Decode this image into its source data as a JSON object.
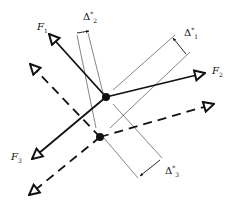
{
  "diagram": {
    "forces": [
      {
        "id": "F1",
        "label": "F",
        "sub": "1"
      },
      {
        "id": "F2",
        "label": "F",
        "sub": "2"
      },
      {
        "id": "F3",
        "label": "F",
        "sub": "3"
      }
    ],
    "offsets": [
      {
        "id": "delta1",
        "label": "Δ",
        "sub": "1",
        "sup": "*"
      },
      {
        "id": "delta2",
        "label": "Δ",
        "sub": "2",
        "sup": "*"
      },
      {
        "id": "delta3",
        "label": "Δ",
        "sub": "3",
        "sup": "*"
      }
    ],
    "line_styles": {
      "original": "solid",
      "displaced": "dashed"
    },
    "colors": {
      "ink": "#111111",
      "thin": "#333333",
      "background": "#ffffff"
    }
  }
}
